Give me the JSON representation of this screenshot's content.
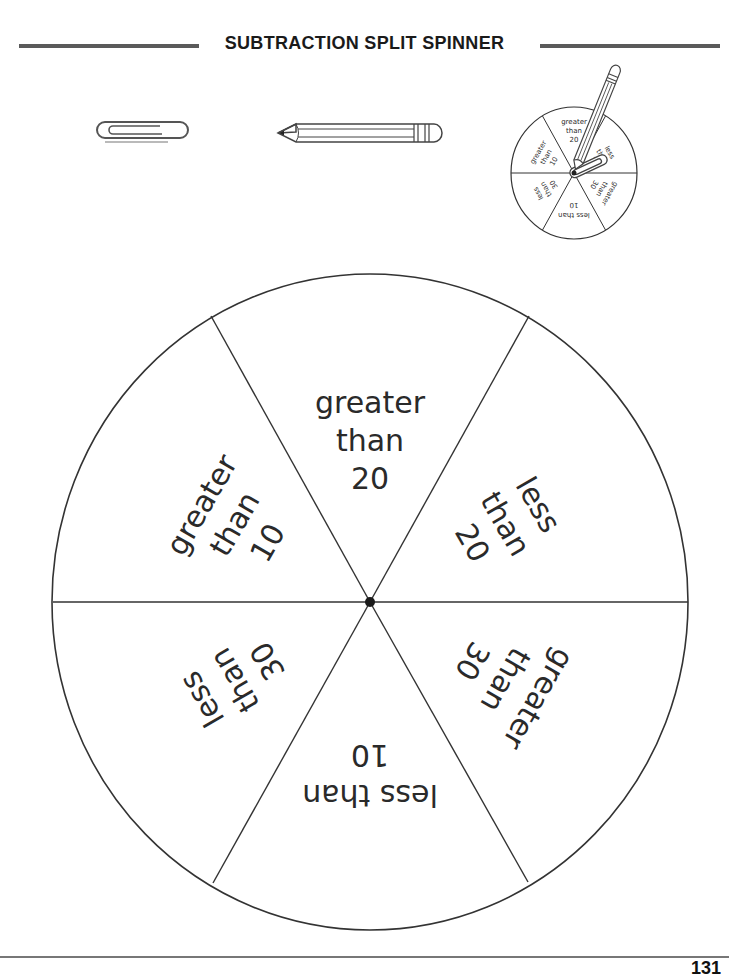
{
  "header": {
    "title": "SUBTRACTION SPLIT SPINNER"
  },
  "illustrations": {
    "paperclip": {
      "icon": "paperclip-icon"
    },
    "pencil": {
      "icon": "pencil-icon"
    },
    "example_spinner": {
      "icon": "spinner-example-icon",
      "segments": [
        {
          "line1": "greater",
          "line2": "than",
          "line3": "20"
        },
        {
          "line1": "less",
          "line2": "than",
          "line3": "20"
        },
        {
          "line1": "greater",
          "line2": "than",
          "line3": "30"
        },
        {
          "line1": "less than",
          "line2": "10",
          "line3": ""
        },
        {
          "line1": "less",
          "line2": "than",
          "line3": "30"
        },
        {
          "line1": "greater",
          "line2": "than",
          "line3": "10"
        }
      ]
    }
  },
  "spinner": {
    "segments": [
      {
        "name": "greater-than-20",
        "line1": "greater",
        "line2": "than",
        "line3": "20",
        "rotation": 0
      },
      {
        "name": "less-than-20",
        "line1": "less",
        "line2": "than",
        "line3": "20",
        "rotation": 60
      },
      {
        "name": "greater-than-30",
        "line1": "greater",
        "line2": "than",
        "line3": "30",
        "rotation": 120
      },
      {
        "name": "less-than-10",
        "line1": "less than",
        "line2": "10",
        "line3": "",
        "rotation": 180
      },
      {
        "name": "less-than-30",
        "line1": "less",
        "line2": "than",
        "line3": "30",
        "rotation": 240
      },
      {
        "name": "greater-than-10",
        "line1": "greater",
        "line2": "than",
        "line3": "10",
        "rotation": 300
      }
    ]
  },
  "footer": {
    "page_number": "131"
  }
}
